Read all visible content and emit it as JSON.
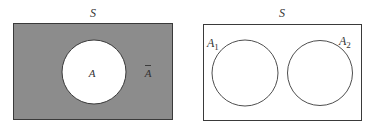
{
  "colors": {
    "shade": "#8c8c8c",
    "stroke": "#3a3a3a",
    "background": "#ffffff"
  },
  "diagrams": [
    {
      "name": "complement",
      "universe_label": "S",
      "set_label": "A",
      "complement_label": "A",
      "complement_bar": true
    },
    {
      "name": "disjoint-sets",
      "universe_label": "S",
      "sets": [
        {
          "label": "A",
          "subscript": "1"
        },
        {
          "label": "A",
          "subscript": "2"
        }
      ]
    }
  ]
}
